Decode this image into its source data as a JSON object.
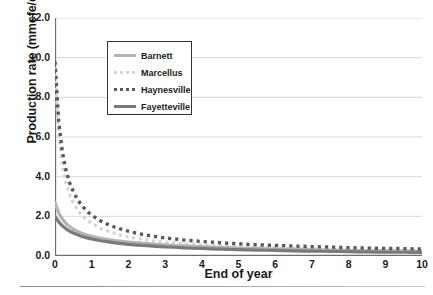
{
  "chart_data": {
    "type": "line",
    "title": "",
    "xlabel": "End of year",
    "ylabel": "Production rate (mmcfe/d)",
    "xlim": [
      0,
      10
    ],
    "ylim": [
      0,
      12
    ],
    "xticks": [
      "0",
      "1",
      "2",
      "3",
      "4",
      "5",
      "6",
      "7",
      "8",
      "9",
      "10"
    ],
    "yticks": [
      "0.0",
      "2.0",
      "4.0",
      "6.0",
      "8.0",
      "10.0",
      "12.0"
    ],
    "ytick_values": [
      0.0,
      2.0,
      4.0,
      6.0,
      8.0,
      10.0,
      12.0
    ],
    "xtick_values": [
      0,
      1,
      2,
      3,
      4,
      5,
      6,
      7,
      8,
      9,
      10
    ],
    "grid": "horizontal",
    "legend_position": "upper-left-inset",
    "x": [
      0.0,
      0.1,
      0.2,
      0.3,
      0.4,
      0.5,
      0.6,
      0.7,
      0.8,
      0.9,
      1.0,
      1.25,
      1.5,
      1.75,
      2.0,
      2.25,
      2.5,
      2.75,
      3.0,
      3.25,
      3.5,
      3.75,
      4.0,
      4.25,
      4.5,
      4.75,
      5.0,
      5.25,
      5.5,
      5.75,
      6.0,
      6.25,
      6.5,
      6.75,
      7.0,
      7.25,
      7.5,
      7.75,
      8.0,
      8.25,
      8.5,
      8.75,
      9.0,
      9.25,
      9.5,
      9.75,
      10.0
    ],
    "series": [
      {
        "name": "Barnett",
        "color": "#b3b3b3",
        "style": "solid",
        "width": 3.2,
        "values": [
          2.7,
          2.18,
          1.86,
          1.64,
          1.48,
          1.35,
          1.25,
          1.17,
          1.1,
          1.04,
          0.99,
          0.89,
          0.81,
          0.75,
          0.7,
          0.66,
          0.62,
          0.59,
          0.56,
          0.53,
          0.51,
          0.49,
          0.47,
          0.45,
          0.43,
          0.42,
          0.4,
          0.39,
          0.38,
          0.36,
          0.35,
          0.34,
          0.33,
          0.32,
          0.31,
          0.3,
          0.29,
          0.29,
          0.28,
          0.27,
          0.26,
          0.26,
          0.25,
          0.24,
          0.24,
          0.23,
          0.22
        ]
      },
      {
        "name": "Marcellus",
        "color": "#d4d4d4",
        "style": "dotted",
        "width": 3.2,
        "values": [
          9.5,
          6.1,
          4.55,
          3.66,
          3.08,
          2.67,
          2.36,
          2.12,
          1.93,
          1.77,
          1.64,
          1.39,
          1.21,
          1.07,
          0.97,
          0.88,
          0.81,
          0.75,
          0.7,
          0.66,
          0.62,
          0.59,
          0.56,
          0.53,
          0.51,
          0.49,
          0.47,
          0.45,
          0.43,
          0.42,
          0.4,
          0.39,
          0.38,
          0.36,
          0.35,
          0.34,
          0.33,
          0.32,
          0.31,
          0.31,
          0.3,
          0.29,
          0.28,
          0.28,
          0.27,
          0.26,
          0.26
        ]
      },
      {
        "name": "Haynesville",
        "color": "#595959",
        "style": "dotted",
        "width": 3.4,
        "values": [
          9.8,
          6.8,
          5.25,
          4.32,
          3.69,
          3.24,
          2.89,
          2.62,
          2.4,
          2.21,
          2.06,
          1.76,
          1.54,
          1.38,
          1.25,
          1.14,
          1.05,
          0.98,
          0.91,
          0.86,
          0.81,
          0.77,
          0.73,
          0.7,
          0.67,
          0.64,
          0.62,
          0.59,
          0.57,
          0.55,
          0.53,
          0.52,
          0.5,
          0.49,
          0.47,
          0.46,
          0.45,
          0.43,
          0.42,
          0.41,
          0.4,
          0.39,
          0.38,
          0.38,
          0.37,
          0.36,
          0.35
        ]
      },
      {
        "name": "Fayetteville",
        "color": "#7a7a7a",
        "style": "solid",
        "width": 3.2,
        "values": [
          2.0,
          1.72,
          1.52,
          1.37,
          1.25,
          1.16,
          1.08,
          1.01,
          0.95,
          0.9,
          0.86,
          0.77,
          0.7,
          0.64,
          0.59,
          0.55,
          0.52,
          0.49,
          0.46,
          0.44,
          0.41,
          0.39,
          0.38,
          0.36,
          0.35,
          0.33,
          0.32,
          0.31,
          0.3,
          0.29,
          0.28,
          0.27,
          0.26,
          0.25,
          0.25,
          0.24,
          0.23,
          0.23,
          0.22,
          0.21,
          0.21,
          0.2,
          0.2,
          0.19,
          0.19,
          0.18,
          0.18
        ]
      }
    ]
  },
  "legend": {
    "items": [
      {
        "label": "Barnett"
      },
      {
        "label": "Marcellus"
      },
      {
        "label": "Haynesville"
      },
      {
        "label": "Fayetteville"
      }
    ]
  },
  "colors": {
    "axis": "#6e6e6e",
    "grid": "#d9d9d9",
    "text": "#1a1a1a",
    "legend_border": "#333333",
    "background": "#ffffff"
  }
}
